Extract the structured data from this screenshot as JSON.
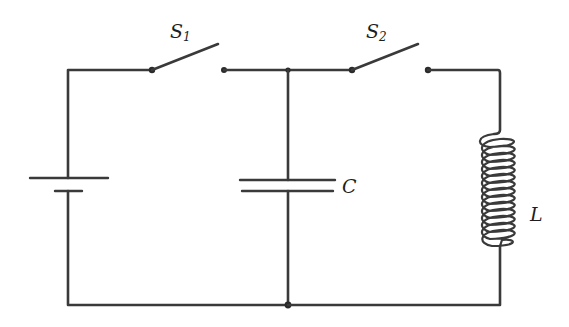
{
  "diagram": {
    "type": "circuit-schematic",
    "colors": {
      "ink": "#3a3a3a",
      "background": "#ffffff"
    },
    "components": [
      {
        "id": "battery",
        "kind": "battery",
        "label": ""
      },
      {
        "id": "switch1",
        "kind": "switch",
        "state": "open",
        "label_main": "S",
        "label_sub": "1"
      },
      {
        "id": "capacitor",
        "kind": "capacitor",
        "label": "C"
      },
      {
        "id": "switch2",
        "kind": "switch",
        "state": "open",
        "label_main": "S",
        "label_sub": "2"
      },
      {
        "id": "inductor",
        "kind": "inductor",
        "label": "L"
      }
    ],
    "labels": {
      "s1": {
        "main": "S",
        "sub": "1"
      },
      "s2": {
        "main": "S",
        "sub": "2"
      },
      "capacitor": "C",
      "inductor": "L"
    },
    "connections": [
      "battery (+) top -> switch S1 -> top junction",
      "top junction -> capacitor C -> bottom junction",
      "top junction -> switch S2 -> inductor L -> bottom rail",
      "bottom rail -> battery bottom"
    ]
  }
}
